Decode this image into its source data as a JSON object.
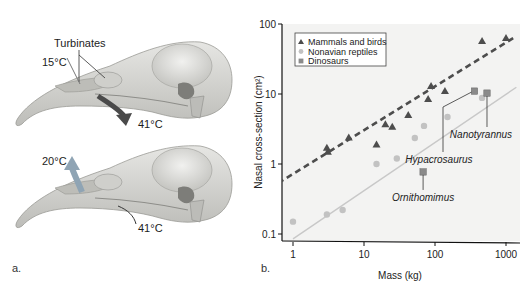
{
  "panel_a": {
    "letter": "a.",
    "top_skull": {
      "label_turbinates": "Turbinates",
      "label_inhale_temp": "15°C",
      "label_body_temp": "41°C"
    },
    "bottom_skull": {
      "label_exhale_temp": "20°C",
      "label_body_temp": "41°C"
    },
    "colors": {
      "bone": "#d9d9d6",
      "bone_shade": "#a8a8a4",
      "arrow_in": "#4a4a4a",
      "arrow_out": "#8fa4b4"
    }
  },
  "panel_b": {
    "letter": "b.",
    "callouts": {
      "ornithomimus": "Ornithomimus",
      "hypacrosaurus": "Hypacrosaurus",
      "nanotyrannus": "Nanotyrannus"
    }
  },
  "chart_data": {
    "type": "scatter",
    "title": "",
    "xlabel": "Mass (kg)",
    "ylabel": "Nasal cross-section (cm²)",
    "xscale": "log",
    "yscale": "log",
    "xlim": [
      0.68,
      1500
    ],
    "ylim": [
      0.08,
      100
    ],
    "xticks": [
      1,
      10,
      100,
      1000
    ],
    "xtick_labels": [
      "1",
      "10",
      "100",
      "1000"
    ],
    "yticks": [
      0.1,
      1,
      10,
      100
    ],
    "ytick_labels": [
      "0.1",
      "1",
      "10",
      "100"
    ],
    "grid": false,
    "legend_position": "upper left",
    "series": [
      {
        "name": "Mammals and birds",
        "marker": "triangle",
        "color": "#4d4d4d",
        "points": [
          [
            3.0,
            1.7
          ],
          [
            3.1,
            1.5
          ],
          [
            6.1,
            2.4
          ],
          [
            15,
            1.9
          ],
          [
            20,
            3.7
          ],
          [
            25,
            3.4
          ],
          [
            42,
            5.0
          ],
          [
            80,
            8.5
          ],
          [
            88,
            13
          ],
          [
            138,
            11
          ],
          [
            460,
            57
          ],
          [
            1000,
            63
          ]
        ],
        "fit": {
          "style": "dashed",
          "color": "#4d4d4d",
          "from": [
            0.47,
            0.45
          ],
          "to": [
            1400,
            67
          ]
        }
      },
      {
        "name": "Nonavian reptiles",
        "marker": "circle",
        "color": "#c2c2c2",
        "points": [
          [
            1,
            0.15
          ],
          [
            3,
            0.19
          ],
          [
            5,
            0.22
          ],
          [
            15,
            1.0
          ],
          [
            29,
            1.2
          ],
          [
            52,
            2.35
          ],
          [
            70,
            3.5
          ],
          [
            150,
            4.7
          ],
          [
            460,
            8.8
          ]
        ],
        "fit": {
          "style": "solid",
          "color": "#c8c8c8",
          "from": [
            1,
            0.085
          ],
          "to": [
            1400,
            12.5
          ]
        }
      },
      {
        "name": "Dinosaurs",
        "marker": "square",
        "color": "#8a8a8a",
        "points": [
          {
            "name": "Ornithomimus",
            "x": 68,
            "y": 0.77
          },
          {
            "name": "Hypacrosaurus",
            "x": 360,
            "y": 11
          },
          {
            "name": "Nanotyrannus",
            "x": 540,
            "y": 10.3
          }
        ]
      }
    ]
  }
}
